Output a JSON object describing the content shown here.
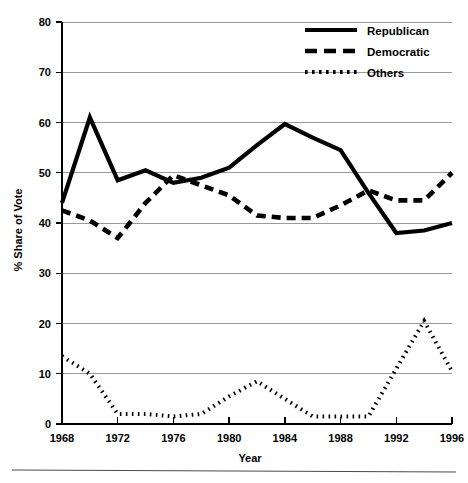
{
  "figure": {
    "background": "#ffffff",
    "line_color": "#000000",
    "grid_color": "#9a9a9a",
    "bottom_rule": true
  },
  "legend": {
    "position": "top-right",
    "entries": [
      {
        "label": "Republican",
        "style": "solid"
      },
      {
        "label": "Democratic",
        "style": "dashed"
      },
      {
        "label": "Others",
        "style": "dotted"
      }
    ]
  },
  "chart_data": {
    "type": "line",
    "title": "",
    "xlabel": "Year",
    "ylabel": "% Share of Vote",
    "xlim": [
      1968,
      1996
    ],
    "ylim": [
      0,
      80
    ],
    "yticks": [
      0,
      10,
      20,
      30,
      40,
      50,
      60,
      70,
      80
    ],
    "xticks": [
      1968,
      1972,
      1976,
      1980,
      1984,
      1988,
      1992,
      1996
    ],
    "xtick_labels": [
      "1968",
      "1972",
      "1976",
      "1980",
      "1984",
      "1988",
      "1992",
      "1996"
    ],
    "ytick_labels": [
      "0",
      "10",
      "20",
      "30",
      "40",
      "50",
      "60",
      "70",
      "80"
    ],
    "grid": "horizontal",
    "legend_position": "upper right",
    "x": [
      1968,
      1970,
      1972,
      1974,
      1976,
      1978,
      1980,
      1982,
      1984,
      1986,
      1988,
      1990,
      1992,
      1994,
      1996
    ],
    "series": [
      {
        "name": "Republican",
        "style": "solid",
        "values": [
          44.0,
          61.0,
          48.5,
          50.5,
          48.0,
          49.0,
          51.0,
          55.5,
          59.7,
          57.0,
          54.5,
          46.0,
          38.0,
          38.5,
          40.0
        ]
      },
      {
        "name": "Democratic",
        "style": "dashed",
        "values": [
          42.5,
          40.5,
          37.0,
          44.0,
          49.5,
          47.5,
          45.5,
          41.5,
          41.0,
          41.0,
          43.5,
          46.5,
          44.5,
          44.5,
          50.0
        ]
      },
      {
        "name": "Others",
        "style": "dotted",
        "values": [
          13.5,
          10.0,
          2.0,
          2.0,
          1.5,
          2.0,
          5.5,
          8.5,
          5.0,
          1.5,
          1.5,
          1.5,
          11.0,
          20.5,
          10.5
        ]
      }
    ]
  }
}
